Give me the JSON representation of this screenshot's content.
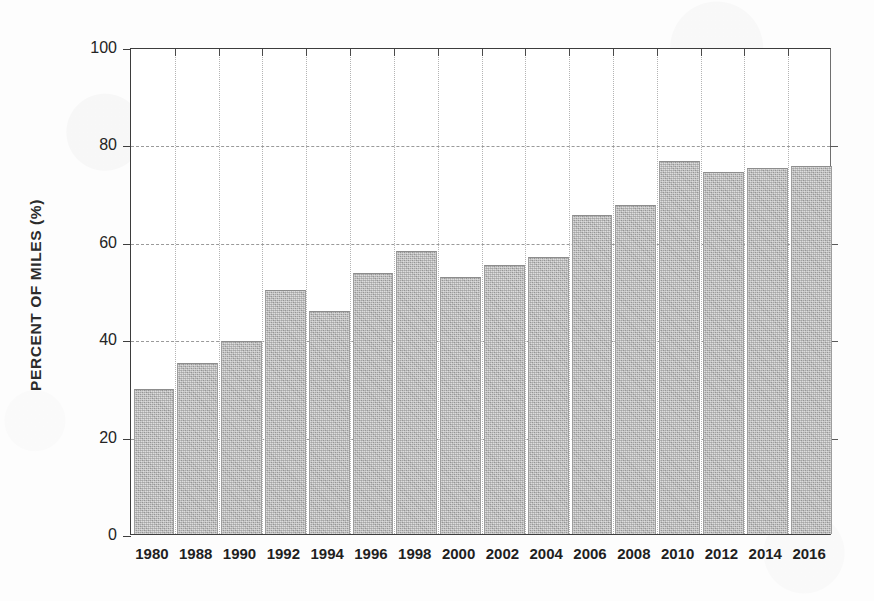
{
  "chart_data": {
    "type": "bar",
    "title": "",
    "subtitle": "",
    "xlabel": "",
    "ylabel": "PERCENT OF MILES (%)",
    "categories": [
      "1980",
      "1988",
      "1990",
      "1992",
      "1994",
      "1996",
      "1998",
      "2000",
      "2002",
      "2004",
      "2006",
      "2008",
      "2010",
      "2012",
      "2014",
      "2016"
    ],
    "values": [
      29.6,
      34.9,
      39.4,
      50.0,
      45.6,
      53.3,
      57.9,
      52.6,
      55.0,
      56.6,
      65.2,
      67.3,
      76.4,
      74.2,
      75.0,
      75.3
    ],
    "series": [
      {
        "name": "Percent of miles",
        "values": [
          29.6,
          34.9,
          39.4,
          50.0,
          45.6,
          53.3,
          57.9,
          52.6,
          55.0,
          56.6,
          65.2,
          67.3,
          76.4,
          74.2,
          75.0,
          75.3
        ]
      }
    ],
    "ylim": [
      0,
      100
    ],
    "ytick_labels": [
      "0",
      "20",
      "40",
      "60",
      "80",
      "100"
    ],
    "ytick_values": [
      0,
      20,
      40,
      60,
      80,
      100
    ],
    "grid": {
      "horizontal": true,
      "vertical": true,
      "horizontal_style": "dashed",
      "vertical_style": "dotted"
    },
    "legend": {
      "visible": false,
      "position": "none",
      "entries": []
    },
    "annotations": [],
    "colors": {
      "bar_fill": "#b2b2b2",
      "bar_edge": "#8d8d8d",
      "axis": "#3d3d3d",
      "hgrid": "#9a9a9a",
      "vgrid": "#b4b4b4",
      "text": "#1f1f1f",
      "background": "#ffffff"
    }
  }
}
